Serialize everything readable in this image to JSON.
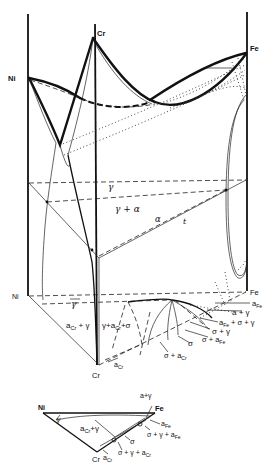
{
  "figure": {
    "type": "ternary phase diagram (prism, 3D)",
    "system": "Fe-Cr-Ni",
    "prism": {
      "corners_top": {
        "ni": "Ni",
        "cr": "Cr",
        "fe": "Fe"
      },
      "corners_bottom": {
        "ni": "Ni",
        "cr": "Cr",
        "fe": "Fe"
      }
    },
    "isothermal_section_labels": {
      "gamma": "γ",
      "gamma_alpha": "γ + α",
      "alpha": "α",
      "t": "t"
    },
    "base_labels": {
      "gamma": "γ",
      "alpha_cr_gamma": "α꜀ᵣ + γ",
      "gamma_alpha_cr_sigma": "γ+α꜀ᵣ+σ",
      "alpha_fe": "α_Fe",
      "alpha_gamma": "α + γ",
      "alpha_fe_sigma_gamma": "α_Fe + σ + γ",
      "sigma_gamma": "σ + γ",
      "sigma_alpha_fe": "σ + α_Fe",
      "sigma": "σ",
      "sigma_alpha_cr": "σ + α꜀ᵣ",
      "alpha_cr": "α꜀ᵣ"
    },
    "base_parts": {
      "alpha_cr_gamma": {
        "main": "a",
        "sub": "Cr",
        "rest": " + γ"
      },
      "gamma_alpha_cr_sigma": {
        "main": "γ+a",
        "sub": "Cr",
        "rest": "+σ"
      },
      "alpha_fe": {
        "main": "a",
        "sub": "Fe"
      },
      "alpha_gamma": "a + γ",
      "alpha_fe_sigma_gamma": {
        "main": "a",
        "sub": "Fe",
        "rest": " + σ + γ"
      },
      "sigma_gamma": "σ + γ",
      "sigma_alpha_fe": {
        "main": "σ + a",
        "sub": "Fe"
      },
      "sigma": "σ",
      "sigma_alpha_cr": {
        "main": "σ + a",
        "sub": "Cr"
      },
      "alpha_cr": {
        "main": "a",
        "sub": "Cr"
      }
    },
    "inset": {
      "corners": {
        "ni": "Ni",
        "fe": "Fe",
        "cr": "Cr"
      },
      "labels": {
        "alpha_gamma": "a+γ",
        "gamma": "γ",
        "alpha_cr_gamma": {
          "main": "a",
          "sub": "Cr",
          "rest": "+γ"
        },
        "alpha_fe": {
          "main": "a",
          "sub": "Fe"
        },
        "sigma_gamma_alpha_fe": {
          "main": "σ + γ + a",
          "sub": "Fe"
        },
        "sigma": "σ",
        "sigma_gamma_alpha_cr": {
          "main": "σ + γ + a",
          "sub": "Cr"
        },
        "alpha_cr": {
          "main": "a",
          "sub": "Cr"
        }
      }
    }
  }
}
